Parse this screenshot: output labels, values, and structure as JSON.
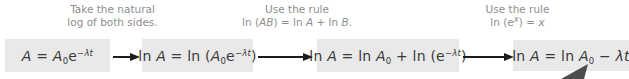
{
  "colors": {
    "background": "#ffffff",
    "box_fill": "#e9e9e9",
    "equation_text": "#3a3a3a",
    "annotation_text": "#8e8e8e",
    "arrow": "#1c1c1c",
    "wedge": "#4d4d4d"
  },
  "steps": [
    {
      "name": "decay-equation",
      "math": [
        {
          "t": "A",
          "s": "i"
        },
        {
          "t": " = "
        },
        {
          "t": "A",
          "s": "i"
        },
        {
          "t": "0",
          "s": "sub"
        },
        {
          "t": "e"
        },
        {
          "t": "−λt",
          "s": "supi"
        }
      ]
    },
    {
      "name": "ln-both-sides",
      "math": [
        {
          "t": "ln "
        },
        {
          "t": "A",
          "s": "i"
        },
        {
          "t": " = ln ("
        },
        {
          "t": "A",
          "s": "i"
        },
        {
          "t": "0",
          "s": "sub"
        },
        {
          "t": "e"
        },
        {
          "t": "−λt",
          "s": "supi"
        },
        {
          "t": ")"
        }
      ]
    },
    {
      "name": "ln-product-expanded",
      "math": [
        {
          "t": "ln "
        },
        {
          "t": "A",
          "s": "i"
        },
        {
          "t": " = ln "
        },
        {
          "t": "A",
          "s": "i"
        },
        {
          "t": "0",
          "s": "sub"
        },
        {
          "t": " + ln (e"
        },
        {
          "t": "−λt",
          "s": "supi"
        },
        {
          "t": ")"
        }
      ]
    },
    {
      "name": "final-linear-form",
      "math": [
        {
          "t": "ln "
        },
        {
          "t": "A",
          "s": "i"
        },
        {
          "t": " = ln "
        },
        {
          "t": "A",
          "s": "i"
        },
        {
          "t": "0",
          "s": "sub"
        },
        {
          "t": " − "
        },
        {
          "t": "λt",
          "s": "i"
        }
      ]
    }
  ],
  "annotations": [
    {
      "line1": [
        {
          "t": "Take the natural"
        }
      ],
      "line2": [
        {
          "t": "log of both sides."
        }
      ]
    },
    {
      "line1": [
        {
          "t": "Use the rule"
        }
      ],
      "line2": [
        {
          "t": "ln ("
        },
        {
          "t": "AB",
          "s": "i"
        },
        {
          "t": ") = ln "
        },
        {
          "t": "A",
          "s": "i"
        },
        {
          "t": " + ln "
        },
        {
          "t": "B",
          "s": "i"
        },
        {
          "t": "."
        }
      ]
    },
    {
      "line1": [
        {
          "t": "Use the rule"
        }
      ],
      "line2": [
        {
          "t": "ln (e"
        },
        {
          "t": "x",
          "s": "supi"
        },
        {
          "t": ") = "
        },
        {
          "t": "x",
          "s": "i"
        }
      ]
    }
  ]
}
